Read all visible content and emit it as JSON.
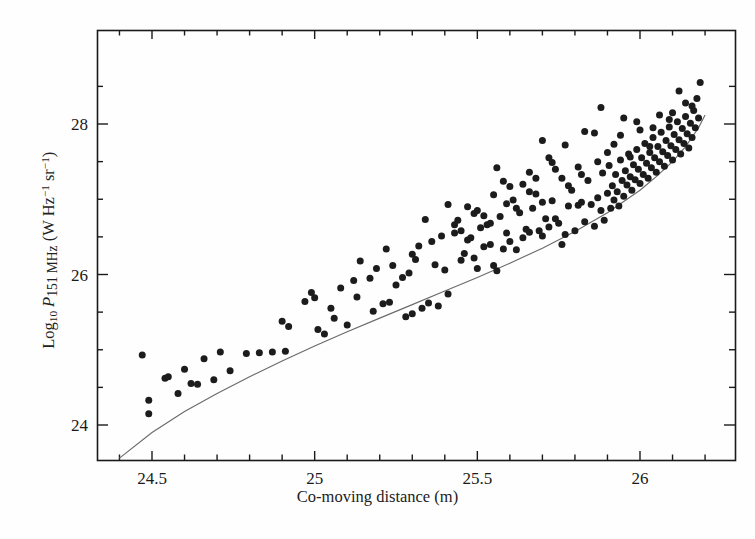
{
  "figure": {
    "background_color": "#fefefe",
    "ink_color": "#1a1a1a",
    "curve_color": "#6b6b6b",
    "point_color": "#1c1c1c"
  },
  "axis_labels": {
    "x_title_part1": "Co-moving distance (m)",
    "y_title_log": "Log",
    "y_title_log_sub": "10",
    "y_title_p": "P",
    "y_title_p_sub": "151 MHz",
    "y_title_units_open": " (W Hz",
    "y_title_units_sup1": "−1",
    "y_title_units_sr": " sr",
    "y_title_units_sup2": "−1",
    "y_title_units_close": ")"
  },
  "chart_data": {
    "type": "scatter",
    "title": "",
    "xlabel": "Co-moving distance (m)",
    "ylabel": "Log10 P 151 MHz (W Hz^-1 sr^-1)",
    "xlim": [
      24.35,
      26.2
    ],
    "ylim": [
      23.55,
      28.75
    ],
    "xticks_major": [
      24.5,
      25.0,
      25.5,
      26.0
    ],
    "xticks_major_labels": [
      "24.5",
      "25",
      "25.5",
      "26"
    ],
    "xtick_minor_step": 0.1,
    "yticks_major": [
      24,
      26,
      28
    ],
    "yticks_major_labels": [
      "24",
      "26",
      "28"
    ],
    "ytick_minor_step": 0.5,
    "grid": false,
    "legend": "none",
    "marker": "filled-circle",
    "marker_size_px": 7,
    "series": [
      {
        "name": "3CRR sources",
        "points": [
          [
            24.47,
            24.93
          ],
          [
            24.49,
            24.33
          ],
          [
            24.49,
            24.15
          ],
          [
            24.54,
            24.62
          ],
          [
            24.55,
            24.64
          ],
          [
            24.58,
            24.42
          ],
          [
            24.6,
            24.74
          ],
          [
            24.62,
            24.55
          ],
          [
            24.64,
            24.54
          ],
          [
            24.66,
            24.88
          ],
          [
            24.69,
            24.6
          ],
          [
            24.71,
            24.97
          ],
          [
            24.74,
            24.72
          ],
          [
            24.79,
            24.95
          ],
          [
            24.83,
            24.96
          ],
          [
            24.87,
            24.97
          ],
          [
            24.91,
            24.98
          ],
          [
            24.92,
            25.31
          ],
          [
            24.99,
            25.76
          ],
          [
            25.0,
            25.69
          ],
          [
            25.01,
            25.27
          ],
          [
            25.03,
            25.21
          ],
          [
            25.06,
            25.42
          ],
          [
            25.1,
            25.33
          ],
          [
            25.12,
            25.92
          ],
          [
            25.14,
            26.18
          ],
          [
            25.18,
            25.51
          ],
          [
            25.21,
            25.61
          ],
          [
            25.23,
            25.63
          ],
          [
            25.25,
            25.86
          ],
          [
            25.27,
            25.96
          ],
          [
            25.28,
            25.44
          ],
          [
            25.3,
            25.48
          ],
          [
            25.32,
            26.38
          ],
          [
            25.33,
            25.55
          ],
          [
            25.35,
            25.62
          ],
          [
            25.37,
            26.13
          ],
          [
            25.38,
            25.58
          ],
          [
            25.4,
            26.06
          ],
          [
            25.41,
            25.74
          ],
          [
            25.43,
            26.55
          ],
          [
            25.45,
            26.19
          ],
          [
            25.46,
            26.28
          ],
          [
            25.47,
            26.46
          ],
          [
            25.48,
            26.49
          ],
          [
            25.49,
            26.22
          ],
          [
            25.5,
            26.08
          ],
          [
            25.51,
            26.62
          ],
          [
            25.52,
            26.37
          ],
          [
            25.53,
            26.66
          ],
          [
            25.54,
            26.4
          ],
          [
            25.55,
            26.12
          ],
          [
            25.56,
            26.05
          ],
          [
            25.57,
            26.77
          ],
          [
            25.58,
            26.34
          ],
          [
            25.59,
            26.55
          ],
          [
            25.6,
            26.44
          ],
          [
            25.61,
            26.99
          ],
          [
            25.62,
            26.33
          ],
          [
            25.63,
            26.82
          ],
          [
            25.64,
            26.49
          ],
          [
            25.65,
            26.6
          ],
          [
            25.66,
            26.56
          ],
          [
            25.67,
            26.88
          ],
          [
            25.68,
            27.28
          ],
          [
            25.69,
            26.58
          ],
          [
            25.7,
            26.51
          ],
          [
            25.71,
            26.74
          ],
          [
            25.72,
            26.63
          ],
          [
            25.73,
            26.98
          ],
          [
            25.74,
            26.74
          ],
          [
            25.75,
            26.68
          ],
          [
            25.76,
            26.4
          ],
          [
            25.77,
            26.53
          ],
          [
            25.78,
            26.91
          ],
          [
            25.79,
            27.12
          ],
          [
            25.8,
            26.58
          ],
          [
            25.81,
            26.92
          ],
          [
            25.82,
            26.96
          ],
          [
            25.83,
            26.7
          ],
          [
            25.84,
            27.25
          ],
          [
            25.85,
            26.93
          ],
          [
            25.86,
            26.64
          ],
          [
            25.87,
            27.02
          ],
          [
            25.88,
            26.85
          ],
          [
            25.885,
            27.35
          ],
          [
            25.89,
            26.72
          ],
          [
            25.9,
            27.08
          ],
          [
            25.905,
            27.45
          ],
          [
            25.91,
            26.88
          ],
          [
            25.915,
            27.18
          ],
          [
            25.92,
            26.99
          ],
          [
            25.925,
            27.33
          ],
          [
            25.93,
            27.1
          ],
          [
            25.935,
            26.91
          ],
          [
            25.94,
            27.52
          ],
          [
            25.945,
            27.25
          ],
          [
            25.95,
            27.04
          ],
          [
            25.955,
            27.38
          ],
          [
            25.96,
            27.19
          ],
          [
            25.965,
            27.6
          ],
          [
            25.97,
            27.3
          ],
          [
            25.975,
            27.12
          ],
          [
            25.98,
            27.46
          ],
          [
            25.985,
            27.26
          ],
          [
            25.99,
            27.66
          ],
          [
            25.995,
            27.4
          ],
          [
            26.0,
            27.21
          ],
          [
            26.005,
            27.55
          ],
          [
            26.01,
            27.33
          ],
          [
            26.015,
            27.74
          ],
          [
            26.02,
            27.48
          ],
          [
            26.025,
            27.28
          ],
          [
            26.03,
            27.62
          ],
          [
            26.035,
            27.42
          ],
          [
            26.04,
            27.82
          ],
          [
            26.045,
            27.55
          ],
          [
            26.05,
            27.36
          ],
          [
            26.055,
            27.7
          ],
          [
            26.06,
            27.5
          ],
          [
            26.065,
            27.89
          ],
          [
            26.07,
            27.63
          ],
          [
            26.075,
            27.44
          ],
          [
            26.08,
            27.78
          ],
          [
            26.085,
            27.58
          ],
          [
            26.09,
            27.96
          ],
          [
            26.095,
            27.71
          ],
          [
            26.1,
            27.52
          ],
          [
            26.105,
            27.86
          ],
          [
            26.11,
            27.66
          ],
          [
            26.115,
            28.03
          ],
          [
            26.12,
            27.79
          ],
          [
            26.125,
            27.6
          ],
          [
            26.13,
            27.94
          ],
          [
            26.135,
            27.74
          ],
          [
            26.14,
            28.1
          ],
          [
            26.145,
            27.87
          ],
          [
            26.15,
            27.68
          ],
          [
            26.155,
            28.01
          ],
          [
            26.16,
            27.82
          ],
          [
            26.165,
            28.18
          ],
          [
            26.17,
            27.95
          ],
          [
            26.175,
            28.34
          ],
          [
            26.18,
            28.08
          ],
          [
            26.185,
            28.55
          ],
          [
            26.16,
            28.24
          ],
          [
            26.1,
            28.15
          ],
          [
            26.04,
            27.95
          ],
          [
            25.99,
            28.03
          ],
          [
            25.94,
            27.85
          ],
          [
            25.88,
            28.22
          ],
          [
            25.83,
            27.9
          ],
          [
            25.77,
            27.72
          ],
          [
            25.73,
            27.49
          ],
          [
            25.7,
            27.78
          ],
          [
            25.66,
            27.36
          ],
          [
            25.6,
            27.17
          ],
          [
            25.56,
            27.42
          ],
          [
            25.5,
            26.85
          ],
          [
            25.44,
            26.72
          ],
          [
            25.41,
            26.93
          ],
          [
            25.36,
            26.44
          ],
          [
            25.3,
            26.27
          ],
          [
            25.24,
            26.12
          ],
          [
            25.17,
            25.95
          ],
          [
            25.08,
            25.82
          ],
          [
            24.97,
            25.64
          ],
          [
            24.9,
            25.38
          ],
          [
            26.12,
            28.44
          ],
          [
            26.06,
            28.12
          ],
          [
            26.0,
            27.92
          ],
          [
            25.95,
            28.08
          ],
          [
            25.9,
            27.62
          ],
          [
            25.86,
            27.88
          ],
          [
            25.81,
            27.43
          ],
          [
            25.76,
            27.28
          ],
          [
            25.72,
            27.55
          ],
          [
            25.68,
            27.07
          ],
          [
            25.64,
            27.2
          ],
          [
            25.59,
            26.94
          ],
          [
            25.55,
            27.06
          ],
          [
            25.52,
            26.78
          ],
          [
            25.47,
            26.9
          ],
          [
            25.43,
            26.66
          ],
          [
            25.39,
            26.51
          ],
          [
            25.34,
            26.73
          ],
          [
            25.29,
            26.02
          ],
          [
            25.22,
            26.34
          ],
          [
            25.13,
            25.7
          ],
          [
            25.05,
            25.55
          ],
          [
            26.14,
            28.28
          ],
          [
            26.09,
            28.06
          ],
          [
            26.03,
            27.7
          ],
          [
            25.97,
            27.56
          ],
          [
            25.92,
            27.73
          ],
          [
            25.87,
            27.5
          ],
          [
            25.82,
            27.33
          ],
          [
            25.78,
            27.18
          ],
          [
            25.74,
            27.4
          ],
          [
            25.7,
            26.96
          ],
          [
            25.66,
            27.1
          ],
          [
            25.62,
            26.88
          ],
          [
            25.58,
            27.24
          ],
          [
            25.54,
            26.68
          ],
          [
            25.49,
            26.81
          ],
          [
            25.45,
            26.58
          ],
          [
            25.31,
            26.2
          ],
          [
            25.19,
            26.08
          ]
        ]
      }
    ],
    "fit_curve": {
      "name": "flux-limit envelope",
      "style": "solid-thin",
      "color": "#6b6b6b",
      "points": [
        [
          24.4,
          23.56
        ],
        [
          24.5,
          23.9
        ],
        [
          24.6,
          24.18
        ],
        [
          24.7,
          24.42
        ],
        [
          24.8,
          24.64
        ],
        [
          24.9,
          24.85
        ],
        [
          25.0,
          25.05
        ],
        [
          25.1,
          25.24
        ],
        [
          25.2,
          25.42
        ],
        [
          25.3,
          25.6
        ],
        [
          25.4,
          25.78
        ],
        [
          25.5,
          25.96
        ],
        [
          25.6,
          26.15
        ],
        [
          25.7,
          26.35
        ],
        [
          25.8,
          26.57
        ],
        [
          25.9,
          26.82
        ],
        [
          26.0,
          27.12
        ],
        [
          26.05,
          27.3
        ],
        [
          26.1,
          27.5
        ],
        [
          26.14,
          27.7
        ],
        [
          26.18,
          27.95
        ],
        [
          26.2,
          28.12
        ]
      ]
    }
  }
}
